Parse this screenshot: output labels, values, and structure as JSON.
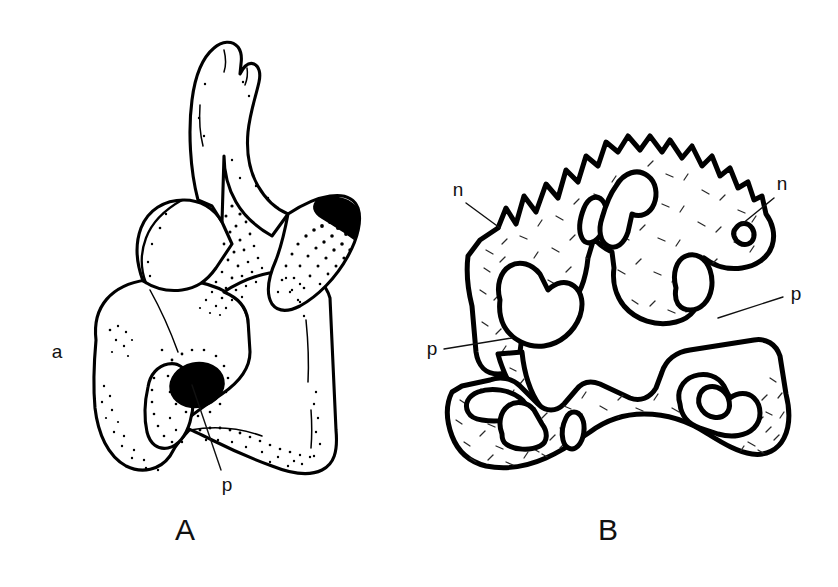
{
  "figure": {
    "background_color": "#ffffff",
    "ink_color": "#000000",
    "width": 838,
    "height": 587
  },
  "panels": [
    {
      "id": "A",
      "label": "A",
      "label_x": 185,
      "label_y": 540,
      "view": "external",
      "shading_style": "stipple",
      "annotations": [
        {
          "id": "a-label-a",
          "text": "a",
          "x": 57,
          "y": 358,
          "leader": null
        },
        {
          "id": "a-label-p",
          "text": "p",
          "x": 227,
          "y": 491,
          "leader": {
            "x1": 221,
            "y1": 470,
            "x2": 192,
            "y2": 385
          }
        }
      ]
    },
    {
      "id": "B",
      "label": "B",
      "label_x": 608,
      "label_y": 540,
      "view": "cross-section",
      "shading_style": "hatch",
      "annotations": [
        {
          "id": "b-label-n-left",
          "text": "n",
          "x": 458,
          "y": 196,
          "leader": {
            "x1": 466,
            "y1": 203,
            "x2": 500,
            "y2": 228
          }
        },
        {
          "id": "b-label-n-right",
          "text": "n",
          "x": 782,
          "y": 190,
          "leader": {
            "x1": 774,
            "y1": 198,
            "x2": 742,
            "y2": 224
          }
        },
        {
          "id": "b-label-p-right",
          "text": "p",
          "x": 796,
          "y": 300,
          "leader": {
            "x1": 783,
            "y1": 297,
            "x2": 718,
            "y2": 318
          }
        },
        {
          "id": "b-label-p-left",
          "text": "p",
          "x": 432,
          "y": 355,
          "leader": {
            "x1": 444,
            "y1": 349,
            "x2": 512,
            "y2": 338
          }
        }
      ]
    }
  ]
}
